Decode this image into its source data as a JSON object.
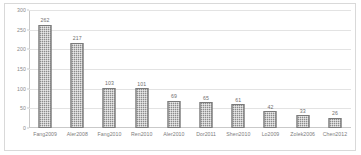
{
  "chart_data": {
    "type": "bar",
    "title": "",
    "subtitle": "",
    "xlabel": "",
    "ylabel": "",
    "ylim": [
      0,
      300
    ],
    "yticks": [
      0,
      50,
      100,
      150,
      200,
      250,
      300
    ],
    "ytick_labels": [
      "0",
      "50",
      "100",
      "150",
      "200",
      "250",
      "300"
    ],
    "grid": true,
    "legend": false,
    "legend_position": "none",
    "bar_color": "#8c8c8c",
    "bar_edge_color": "#7a7a7a",
    "grid_color": "#e3e3e3",
    "axis_color": "#c9c9c9",
    "text_color": "#7d7d7d",
    "value_labels_shown": true,
    "categories": [
      "Fang2009",
      "Aler2008",
      "Fang2010",
      "Ren2010",
      "Aler2010",
      "Dor2011",
      "Shen2010",
      "Lo2009",
      "Zolek2006",
      "Chen2012"
    ],
    "values": [
      262,
      217,
      103,
      101,
      69,
      65,
      61,
      42,
      33,
      26
    ],
    "value_labels": [
      "262",
      "217",
      "103",
      "101",
      "69",
      "65",
      "61",
      "42",
      "33",
      "26"
    ]
  }
}
